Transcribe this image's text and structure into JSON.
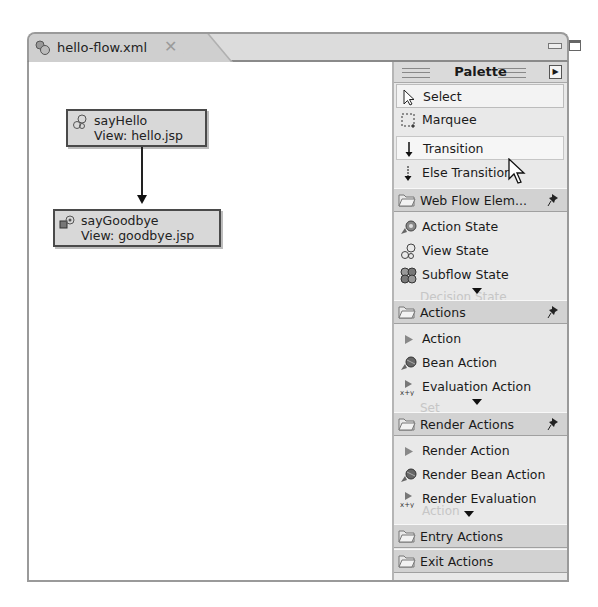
{
  "editor": {
    "tab_title": "hello-flow.xml",
    "tab_icon": "flow-file-icon",
    "close_icon": "close-icon",
    "window_controls": [
      "minimize",
      "maximize"
    ]
  },
  "canvas": {
    "nodes": [
      {
        "name": "sayHello",
        "view": "View: hello.jsp",
        "icon": "view-state-icon"
      },
      {
        "name": "sayGoodbye",
        "view": "View: goodbye.jsp",
        "icon": "end-state-icon"
      }
    ],
    "transitions": [
      {
        "from": "sayHello",
        "to": "sayGoodbye"
      }
    ]
  },
  "palette": {
    "title": "Palette",
    "tools": [
      {
        "label": "Select",
        "icon": "arrow-cursor-icon",
        "state": "selected"
      },
      {
        "label": "Marquee",
        "icon": "marquee-icon"
      },
      {
        "label": "Transition",
        "icon": "transition-arrow-icon",
        "state": "hover"
      },
      {
        "label": "Else Transition",
        "icon": "else-transition-icon"
      }
    ],
    "drawers": [
      {
        "label": "Web Flow Elem...",
        "pinned": true,
        "items": [
          {
            "label": "Action State",
            "icon": "action-state-icon"
          },
          {
            "label": "View State",
            "icon": "view-state-icon"
          },
          {
            "label": "Subflow State",
            "icon": "subflow-state-icon"
          }
        ],
        "hidden_item": "Decision State"
      },
      {
        "label": "Actions",
        "pinned": true,
        "items": [
          {
            "label": "Action",
            "icon": "action-icon"
          },
          {
            "label": "Bean Action",
            "icon": "bean-action-icon"
          },
          {
            "label": "Evaluation Action",
            "icon": "evaluation-action-icon"
          }
        ],
        "hidden_item": "Set"
      },
      {
        "label": "Render Actions",
        "pinned": true,
        "items": [
          {
            "label": "Render Action",
            "icon": "action-icon"
          },
          {
            "label": "Render Bean Action",
            "icon": "bean-action-icon"
          },
          {
            "label": "Render Evaluation",
            "label2": "Action",
            "icon": "evaluation-action-icon"
          }
        ]
      },
      {
        "label": "Entry Actions",
        "pinned": false
      },
      {
        "label": "Exit Actions",
        "pinned": false
      }
    ]
  }
}
